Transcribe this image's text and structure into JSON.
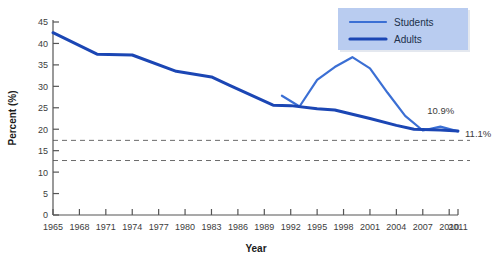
{
  "chart_data": {
    "type": "line",
    "title": "",
    "xlabel": "Year",
    "ylabel": "Percent (%)",
    "xlim": [
      1965,
      2011
    ],
    "ylim": [
      0,
      45
    ],
    "ytick_step": 5,
    "grid": false,
    "legend_position": "top-right",
    "xticks": [
      "1965",
      "1968",
      "1971",
      "1974",
      "1977",
      "1980",
      "1983",
      "1986",
      "1989",
      "1992",
      "1995",
      "1998",
      "2001",
      "2004",
      "2007",
      "2010",
      "2011"
    ],
    "yticks": [
      "0",
      "5",
      "10",
      "15",
      "20",
      "25",
      "30",
      "35",
      "40",
      "45"
    ],
    "series": [
      {
        "name": "Students",
        "color": "#3b6fd4",
        "width": 2.2,
        "x": [
          1991,
          1993,
          1995,
          1997,
          1999,
          2001,
          2003,
          2005,
          2007,
          2009,
          2011
        ],
        "values": [
          27.8,
          25.3,
          31.5,
          34.5,
          36.8,
          34.2,
          28.5,
          23.1,
          19.7,
          20.6,
          19.5
        ]
      },
      {
        "name": "Adults",
        "color": "#1b46b4",
        "width": 3.0,
        "x": [
          1965,
          1970,
          1974,
          1979,
          1983,
          1985,
          1990,
          1992,
          1995,
          1997,
          2001,
          2004,
          2006,
          2009,
          2011
        ],
        "values": [
          42.5,
          37.5,
          37.3,
          33.5,
          32.2,
          30.3,
          25.6,
          25.5,
          24.8,
          24.5,
          22.5,
          20.9,
          20.0,
          19.8,
          19.6
        ]
      }
    ],
    "reference_lines": [
      {
        "name": "target-upper",
        "value": 17.4,
        "style": "dashed",
        "color": "#6b6b6b"
      },
      {
        "name": "target-lower",
        "value": 12.7,
        "style": "dashed",
        "color": "#6b6b6b"
      }
    ],
    "annotations": [
      {
        "name": "students-target-label",
        "text": "10.9%",
        "x": 2007.5,
        "y": 23.5
      },
      {
        "name": "adults-target-label",
        "text": "11.1%",
        "x": 2011.8,
        "y": 18.2
      }
    ]
  },
  "legend": {
    "background": "#b9ccf0",
    "items": [
      {
        "label": "Students",
        "color": "#3b6fd4"
      },
      {
        "label": "Adults",
        "color": "#1b46b4"
      }
    ]
  }
}
